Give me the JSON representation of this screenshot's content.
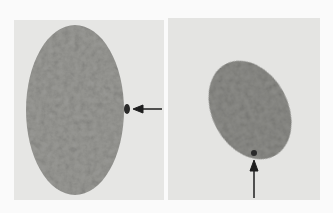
{
  "figure": {
    "panels": [
      {
        "id": "left",
        "subject": "oval-nucleus",
        "arrow_direction": "left",
        "marker": "dark-spot-at-right-edge"
      },
      {
        "id": "right",
        "subject": "oval-nucleus",
        "arrow_direction": "up",
        "marker": "dark-spot-at-bottom-edge"
      }
    ],
    "colors": {
      "background": "#fafafa",
      "field": "#e6e6e4",
      "nucleus": "#9a9a96",
      "nucleus_dark": "#7c7c78",
      "spot": "#2a2a2a",
      "arrow": "#1e1e1e"
    }
  }
}
